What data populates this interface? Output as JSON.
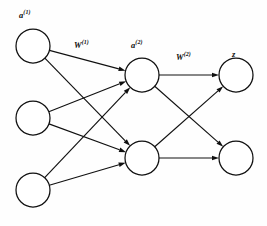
{
  "figure": {
    "name": "feedforward-neural-network",
    "background_color": "#fdfdfd",
    "ink_color": "#101010"
  },
  "labels": {
    "input_layer": {
      "base": "a",
      "superscript": "(1)",
      "text": "a(1)"
    },
    "weights_1": {
      "base": "W",
      "superscript": "(1)",
      "text": "W(1)"
    },
    "hidden_layer": {
      "base": "a",
      "superscript": "(2)",
      "text": "a(2)"
    },
    "weights_2": {
      "base": "W",
      "superscript": "(2)",
      "text": "W(2)"
    },
    "output_layer": {
      "base": "z",
      "superscript": "",
      "text": "z"
    }
  },
  "layers": [
    {
      "id": "input",
      "label_key": "input_layer",
      "node_count": 3,
      "nodes": [
        {
          "id": "i1",
          "cx": 33,
          "cy": 46,
          "r": 17
        },
        {
          "id": "i2",
          "cx": 33,
          "cy": 118,
          "r": 17
        },
        {
          "id": "i3",
          "cx": 33,
          "cy": 190,
          "r": 17
        }
      ]
    },
    {
      "id": "hidden",
      "label_key": "hidden_layer",
      "node_count": 2,
      "nodes": [
        {
          "id": "h1",
          "cx": 142,
          "cy": 75,
          "r": 17
        },
        {
          "id": "h2",
          "cx": 142,
          "cy": 158,
          "r": 17
        }
      ]
    },
    {
      "id": "output",
      "label_key": "output_layer",
      "node_count": 2,
      "nodes": [
        {
          "id": "o1",
          "cx": 236,
          "cy": 75,
          "r": 17
        },
        {
          "id": "o2",
          "cx": 236,
          "cy": 158,
          "r": 17
        }
      ]
    }
  ],
  "edges": [
    {
      "from": "i1",
      "to": "h1",
      "group": "weights_1"
    },
    {
      "from": "i1",
      "to": "h2",
      "group": "weights_1"
    },
    {
      "from": "i2",
      "to": "h1",
      "group": "weights_1"
    },
    {
      "from": "i2",
      "to": "h2",
      "group": "weights_1"
    },
    {
      "from": "i3",
      "to": "h1",
      "group": "weights_1"
    },
    {
      "from": "i3",
      "to": "h2",
      "group": "weights_1"
    },
    {
      "from": "h1",
      "to": "o1",
      "group": "weights_2"
    },
    {
      "from": "h1",
      "to": "o2",
      "group": "weights_2"
    },
    {
      "from": "h2",
      "to": "o1",
      "group": "weights_2"
    },
    {
      "from": "h2",
      "to": "o2",
      "group": "weights_2"
    }
  ],
  "arrowhead": {
    "style": "solid-triangle",
    "length": 7,
    "width": 4.6
  }
}
